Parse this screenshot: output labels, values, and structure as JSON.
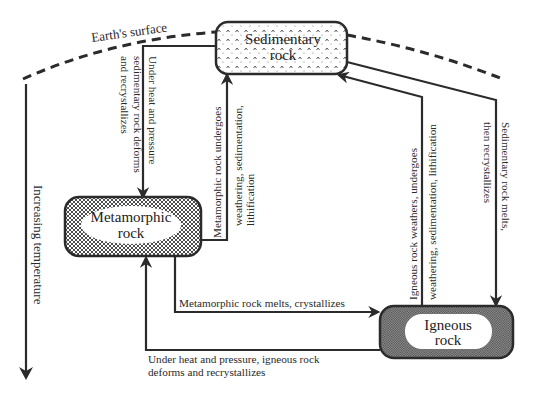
{
  "diagram": {
    "surface_label": "Earth's surface",
    "temperature_axis_label": "Increasing temperature",
    "nodes": {
      "sedimentary": {
        "line1": "Sedimentary",
        "line2": "rock"
      },
      "metamorphic": {
        "line1": "Metamorphic",
        "line2": "rock"
      },
      "igneous": {
        "line1": "Igneous",
        "line2": "rock"
      }
    },
    "edges": {
      "sed_to_meta": {
        "line1": "Under heat and pressure",
        "line2": "sedimentary rock deforms",
        "line3": "and recrystallizes"
      },
      "meta_to_sed": {
        "line1": "Metamorphic rock undergoes",
        "line2": "weathering, sedimentation,",
        "line3": "lithification"
      },
      "ign_to_sed": {
        "line1": "Igneous rock weathers, undergoes",
        "line2": "weathering, sedimentation, lithification"
      },
      "sed_to_ign": {
        "line1": "Sedimentary rock melts,",
        "line2": "then recrystallizes"
      },
      "meta_to_ign": {
        "line1": "Metamorphic rock melts, crystallizes"
      },
      "ign_to_meta": {
        "line1": "Under heat and pressure, igneous rock",
        "line2": "deforms and recrystallizes"
      }
    },
    "colors": {
      "line": "#2b2b2b",
      "background": "#ffffff",
      "sedimentary_fill": "#ffffff",
      "metamorphic_fill": "#8a8a8a",
      "igneous_fill": "#6e6e6e"
    }
  }
}
